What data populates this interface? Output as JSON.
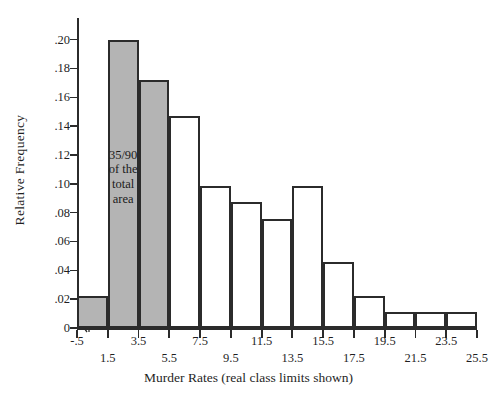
{
  "chart_data": {
    "type": "bar",
    "title": "",
    "xlabel": "Murder Rates (real class limits shown)",
    "ylabel": "Relative Frequency",
    "categories": [
      "-.5 to 1.5",
      "1.5 to 3.5",
      "3.5 to 5.5",
      "5.5 to 7.5",
      "7.5 to 9.5",
      "9.5 to 11.5",
      "11.5 to 13.5",
      "13.5 to 15.5",
      "15.5 to 17.5",
      "17.5 to 19.5",
      "19.5 to 21.5",
      "21.5 to 23.5",
      "23.5 to 25.5"
    ],
    "bin_edges": [
      -0.5,
      1.5,
      3.5,
      5.5,
      7.5,
      9.5,
      11.5,
      13.5,
      15.5,
      17.5,
      19.5,
      21.5,
      23.5,
      25.5
    ],
    "values": [
      0.022,
      0.2,
      0.172,
      0.147,
      0.0985,
      0.0875,
      0.0755,
      0.0985,
      0.0455,
      0.022,
      0.011,
      0.011,
      0.011
    ],
    "bar_fill": [
      "shaded",
      "shaded",
      "shaded",
      "plain",
      "plain",
      "plain",
      "plain",
      "plain",
      "plain",
      "plain",
      "plain",
      "plain",
      "plain"
    ],
    "shaded_color": "#b4b4b4",
    "plain_color": "#ffffff",
    "outline_color": "#2b2b2b",
    "xlim": [
      -0.5,
      25.5
    ],
    "ylim": [
      0,
      0.215
    ],
    "grid": false,
    "legend": null,
    "ytick_values": [
      0,
      0.02,
      0.04,
      0.06,
      0.08,
      0.1,
      0.12,
      0.14,
      0.16,
      0.18,
      0.2
    ],
    "ytick_labels": [
      "0",
      ".02",
      ".04",
      ".06",
      ".08",
      ".10",
      ".12",
      ".14",
      ".16",
      ".18",
      ".20"
    ],
    "xtick_values": [
      -0.5,
      1.5,
      3.5,
      5.5,
      7.5,
      9.5,
      11.5,
      13.5,
      15.5,
      17.5,
      19.5,
      21.5,
      23.5,
      25.5
    ],
    "xtick_labels": [
      "-.5",
      "1.5",
      "3.5",
      "5.5",
      "7.5",
      "9.5",
      "11.5",
      "13.5",
      "15.5",
      "17.5",
      "19.5",
      "21.5",
      "23.5",
      "25.5"
    ],
    "xtick_label_rows": [
      0,
      1,
      0,
      1,
      0,
      1,
      0,
      1,
      0,
      1,
      0,
      1,
      0,
      1
    ],
    "annotations": [
      {
        "lines": [
          "35/90",
          "of the",
          "total",
          "area"
        ],
        "x_center": 2.5,
        "y_center": 0.105
      }
    ]
  }
}
